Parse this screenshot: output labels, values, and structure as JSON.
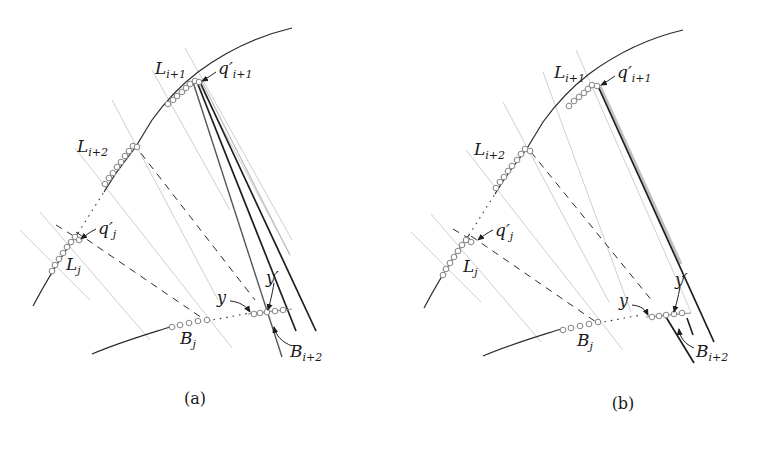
{
  "figure": {
    "panels": [
      {
        "id": "a",
        "caption": "(a)",
        "labels": {
          "L_i1": "L",
          "L_i1_sub": "i+1",
          "q_i1": "q′",
          "q_i1_sub": "i+1",
          "L_i2": "L",
          "L_i2_sub": "i+2",
          "q_j": "q′",
          "q_j_sub": "j",
          "L_j": "L",
          "L_j_sub": "j",
          "B_j": "B",
          "B_j_sub": "j",
          "y": "y",
          "y_prime": "y′",
          "B_i2": "B",
          "B_i2_sub": "i+2"
        }
      },
      {
        "id": "b",
        "caption": "(b)",
        "labels": {
          "L_i1": "L",
          "L_i1_sub": "i+1",
          "q_i1": "q′",
          "q_i1_sub": "i+1",
          "L_i2": "L",
          "L_i2_sub": "i+2",
          "q_j": "q′",
          "q_j_sub": "j",
          "L_j": "L",
          "L_j_sub": "j",
          "B_j": "B",
          "B_j_sub": "j",
          "y": "y",
          "y_prime": "y′",
          "B_i2": "B",
          "B_i2_sub": "i+2"
        }
      }
    ],
    "colors": {
      "curve": "#2a2a2a",
      "thick_line": "#1e1e1e",
      "light_line": "#c8c8c8",
      "dashed_line": "#2a2a2a",
      "circle_stroke": "#8a8a8a"
    }
  }
}
